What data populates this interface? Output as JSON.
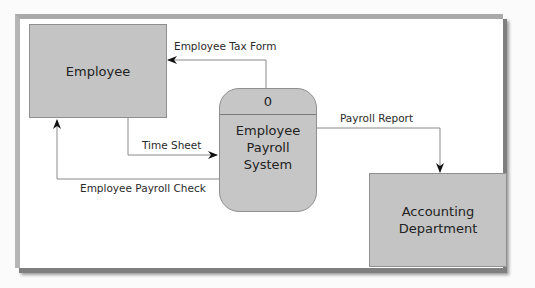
{
  "diagram": {
    "type": "context data flow diagram",
    "entities": {
      "employee": "Employee",
      "accounting": [
        "Accounting",
        "Department"
      ]
    },
    "process": {
      "id": "0",
      "name": [
        "Employee",
        "Payroll",
        "System"
      ]
    },
    "flows": {
      "tax_form": "Employee Tax Form",
      "time_sheet": "Time Sheet",
      "payroll_check": "Employee Payroll Check",
      "payroll_report": "Payroll Report"
    },
    "colors": {
      "box_fill": "#c4c4c4",
      "line": "#8a8a8a",
      "frame_shadow": "#7f7f7f"
    }
  }
}
